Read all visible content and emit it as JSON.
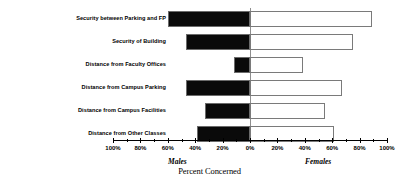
{
  "chart_data": {
    "type": "bar",
    "title": "",
    "subtitle": "",
    "orientation": "horizontal-diverging",
    "xlabel": "Percent Concerned",
    "ylabel": "",
    "xlim": [
      -100,
      100
    ],
    "grid": false,
    "legend_position": "below-axis",
    "axis_tick_labels": [
      "100%",
      "80%",
      "60%",
      "40%",
      "20%",
      "0%",
      "20%",
      "40%",
      "60%",
      "80%",
      "100%"
    ],
    "axis_tick_values": [
      -100,
      -80,
      -60,
      -40,
      -20,
      0,
      20,
      40,
      60,
      80,
      100
    ],
    "minor_tick_interval": 10,
    "categories": [
      "Security between Parking and FP",
      "Security of Building",
      "Distance from Faculty Offices",
      "Distance from Campus Parking",
      "Distance from Campus Facilities",
      "Distance from Other Classes"
    ],
    "series": [
      {
        "name": "Males",
        "side": "left",
        "color": "#0a0a0a",
        "values": [
          60,
          47,
          12,
          47,
          33,
          39
        ]
      },
      {
        "name": "Females",
        "side": "right",
        "color": "#ffffff",
        "values": [
          89,
          75,
          39,
          67,
          55,
          61
        ]
      }
    ]
  },
  "labels": {
    "males": "Males",
    "females": "Females",
    "axis_title": "Percent Concerned"
  }
}
